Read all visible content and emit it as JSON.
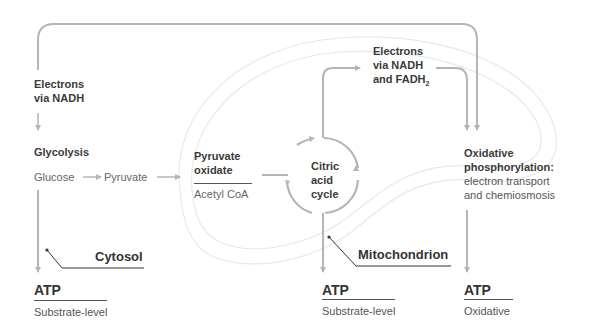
{
  "diagram": {
    "colors": {
      "arrow": "#b5b5b5",
      "outline": "#e6e6e6",
      "text": "#3a3a3a",
      "rule": "#555555"
    },
    "top_path": {
      "line1": "Electrons",
      "line2": "via NADH"
    },
    "glycolysis": {
      "title": "Glycolysis",
      "from": "Glucose",
      "to": "Pyruvate"
    },
    "pyruvate_oxidate": {
      "line1": "Pyruvate",
      "line2": "oxidate",
      "product": "Acetyl CoA"
    },
    "citric_acid_cycle": {
      "line1": "Citric",
      "line2": "acid",
      "line3": "cycle"
    },
    "electrons_nadh_fadh2": {
      "line1": "Electrons",
      "line2": "via NADH",
      "line3": "and FADH",
      "subscript": "2"
    },
    "oxidative_phosphorylation": {
      "line1": "Oxidative",
      "line2": "phosphorylation:",
      "line3": "electron transport",
      "line4": "and chemiosmosis"
    },
    "compartments": {
      "cytosol": "Cytosol",
      "mitochondrion": "Mitochondrion"
    },
    "atp_outputs": [
      {
        "label": "ATP",
        "type": "Substrate-level"
      },
      {
        "label": "ATP",
        "type": "Substrate-level"
      },
      {
        "label": "ATP",
        "type": "Oxidative"
      }
    ]
  }
}
